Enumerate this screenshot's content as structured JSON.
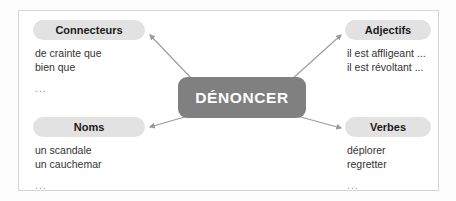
{
  "diagram": {
    "center": {
      "label": "DÉNONCER",
      "color": "#808080",
      "text_color": "#ffffff"
    },
    "pill_color": "#e2e2e2",
    "arrow_color": "#9a9a9a",
    "frame_color": "#d6d6d6",
    "branches": [
      {
        "id": "connecteurs",
        "label": "Connecteurs",
        "items": [
          "de crainte que",
          "bien que"
        ],
        "ellipsis": "..."
      },
      {
        "id": "adjectifs",
        "label": "Adjectifs",
        "items": [
          "il est affligeant ...",
          "il est révoltant ..."
        ],
        "ellipsis": "..."
      },
      {
        "id": "noms",
        "label": "Noms",
        "items": [
          "un scandale",
          "un cauchemar"
        ],
        "ellipsis": "..."
      },
      {
        "id": "verbes",
        "label": "Verbes",
        "items": [
          "déplorer",
          "regretter"
        ],
        "ellipsis": "..."
      }
    ]
  }
}
